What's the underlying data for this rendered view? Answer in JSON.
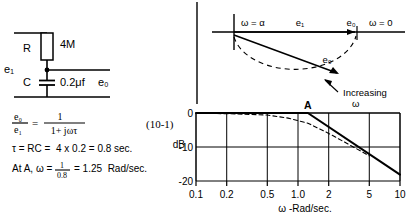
{
  "figure": {
    "title_none": "",
    "equation_number": "(10-1)"
  },
  "circuit": {
    "name": "rc-low-pass-filter",
    "resistor_label": "R",
    "resistor_value": "4M",
    "capacitor_label": "C",
    "capacitor_value": "0.2μf",
    "input_label": "e₁",
    "output_label": "e₀"
  },
  "equations": {
    "transfer_num_left": "e₀",
    "transfer_den_left": "e₁",
    "equals": "=",
    "transfer_num_right": "1",
    "transfer_den_right": "1+ jωτ",
    "line2": "τ = RC =  4 x 0.2 = 0.8 sec.",
    "line3_prefix": "At A, ω =",
    "line3_frac_num": "1",
    "line3_frac_den": "0.8",
    "line3_suffix": "= 1.25  Rad/sec."
  },
  "nyquist": {
    "name": "polar-plot",
    "label_omega_infinity": "ω = α",
    "label_omega_zero": "ω = 0",
    "label_e1": "e₁",
    "label_e0_axis": "e₀",
    "label_e0_vector": "e₀",
    "label_increasing": "Increasing",
    "label_increasing_omega": "ω"
  },
  "chart_data": {
    "type": "line",
    "title": "",
    "xlabel": "ω -Rad/sec.",
    "ylabel": "dB",
    "xscale": "log",
    "xlim": [
      0.1,
      10
    ],
    "ylim": [
      -22,
      1
    ],
    "xticks": [
      0.1,
      0.2,
      0.5,
      1.0,
      2,
      5,
      10
    ],
    "xticklabels": [
      "0.1",
      "0.2",
      "0.5",
      "1.0",
      "2",
      "5",
      "10"
    ],
    "yticks": [
      0,
      -10,
      -20
    ],
    "yticklabels": [
      "0",
      "-10",
      "-20"
    ],
    "grid": true,
    "annotations": [
      {
        "text": "A",
        "x": 1.25,
        "y": 0,
        "note": "breakpoint / corner frequency"
      }
    ],
    "series": [
      {
        "name": "asymptotic-approximation",
        "style": "solid",
        "points": [
          {
            "x": 0.1,
            "y": 0
          },
          {
            "x": 1.25,
            "y": 0
          },
          {
            "x": 10,
            "y": -18.1
          }
        ]
      },
      {
        "name": "actual-response",
        "style": "dashed",
        "points": [
          {
            "x": 0.1,
            "y": -0.07
          },
          {
            "x": 0.2,
            "y": -0.2
          },
          {
            "x": 0.5,
            "y": -0.6
          },
          {
            "x": 0.8,
            "y": -1.5
          },
          {
            "x": 1.25,
            "y": -3.0
          },
          {
            "x": 2.0,
            "y": -6.0
          },
          {
            "x": 3.0,
            "y": -8.9
          },
          {
            "x": 5.0,
            "y": -12.6
          }
        ]
      }
    ]
  }
}
